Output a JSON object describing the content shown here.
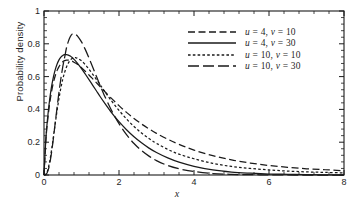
{
  "chart_data": {
    "type": "line",
    "title": "",
    "xlabel": "x",
    "ylabel": "Probability density",
    "xlim": [
      0,
      8
    ],
    "ylim": [
      0,
      1
    ],
    "grid": false,
    "legend_position": "upper-right",
    "x_ticks": [
      "0",
      "2",
      "4",
      "6",
      "8"
    ],
    "x_tick_values": [
      0,
      2,
      4,
      6,
      8
    ],
    "x_minor_per_interval": 4,
    "y_ticks": [
      "0",
      "0.2",
      "0.4",
      "0.6",
      "0.8",
      "1"
    ],
    "y_tick_values": [
      0,
      0.2,
      0.4,
      0.6,
      0.8,
      1
    ],
    "y_minor_per_interval": 4,
    "line_color": "#1a1a1a",
    "series": [
      {
        "name": "u = 4, v = 10",
        "u": 4,
        "v": 10,
        "dash": "medium-dash",
        "peak_x": 0.62,
        "peak_y": 0.7,
        "x": [
          0.0,
          0.05,
          0.1,
          0.15,
          0.2,
          0.25,
          0.3,
          0.35,
          0.4,
          0.45,
          0.5,
          0.55,
          0.6,
          0.65,
          0.7,
          0.75,
          0.8,
          0.85,
          0.9,
          1.0,
          1.1,
          1.2,
          1.3,
          1.4,
          1.5,
          1.6,
          1.8,
          2.0,
          2.2,
          2.4,
          2.6,
          2.8,
          3.0,
          3.3,
          3.6,
          4.0,
          4.5,
          5.0,
          5.5,
          6.0,
          6.5,
          7.0,
          7.5,
          8.0
        ],
        "y": [
          0.0,
          0.212,
          0.339,
          0.434,
          0.507,
          0.563,
          0.605,
          0.638,
          0.661,
          0.678,
          0.69,
          0.697,
          0.7,
          0.7,
          0.698,
          0.694,
          0.688,
          0.681,
          0.673,
          0.654,
          0.633,
          0.61,
          0.586,
          0.562,
          0.538,
          0.514,
          0.467,
          0.423,
          0.382,
          0.345,
          0.311,
          0.281,
          0.254,
          0.218,
          0.187,
          0.152,
          0.118,
          0.092,
          0.073,
          0.058,
          0.047,
          0.038,
          0.032,
          0.026
        ]
      },
      {
        "name": "u = 4, v = 30",
        "u": 4,
        "v": 30,
        "dash": "solid",
        "peak_x": 0.55,
        "peak_y": 0.73,
        "x": [
          0.0,
          0.05,
          0.1,
          0.15,
          0.2,
          0.25,
          0.3,
          0.35,
          0.4,
          0.45,
          0.5,
          0.55,
          0.6,
          0.65,
          0.7,
          0.75,
          0.8,
          0.85,
          0.9,
          1.0,
          1.1,
          1.2,
          1.3,
          1.4,
          1.5,
          1.6,
          1.8,
          2.0,
          2.2,
          2.4,
          2.6,
          2.8,
          3.0,
          3.3,
          3.6,
          4.0,
          4.5,
          5.0,
          5.5,
          6.0,
          6.5,
          7.0,
          7.5,
          8.0
        ],
        "y": [
          0.0,
          0.222,
          0.357,
          0.459,
          0.537,
          0.597,
          0.643,
          0.677,
          0.702,
          0.719,
          0.729,
          0.734,
          0.734,
          0.731,
          0.725,
          0.716,
          0.705,
          0.693,
          0.679,
          0.649,
          0.616,
          0.582,
          0.547,
          0.512,
          0.477,
          0.444,
          0.381,
          0.325,
          0.276,
          0.233,
          0.196,
          0.164,
          0.137,
          0.104,
          0.078,
          0.053,
          0.031,
          0.018,
          0.011,
          0.006,
          0.004,
          0.002,
          0.001,
          0.001
        ]
      },
      {
        "name": "u = 10, v = 10",
        "u": 10,
        "v": 10,
        "dash": "short-dash",
        "peak_x": 0.64,
        "peak_y": 0.75,
        "x": [
          0.0,
          0.05,
          0.1,
          0.15,
          0.2,
          0.25,
          0.3,
          0.35,
          0.4,
          0.45,
          0.5,
          0.55,
          0.6,
          0.65,
          0.7,
          0.75,
          0.8,
          0.85,
          0.9,
          1.0,
          1.1,
          1.2,
          1.3,
          1.4,
          1.5,
          1.6,
          1.8,
          2.0,
          2.2,
          2.4,
          2.6,
          2.8,
          3.0,
          3.3,
          3.6,
          4.0,
          4.5,
          5.0,
          5.5,
          6.0,
          6.5,
          7.0,
          7.5,
          8.0
        ],
        "y": [
          0.0,
          0.005,
          0.03,
          0.08,
          0.15,
          0.231,
          0.315,
          0.395,
          0.468,
          0.531,
          0.584,
          0.626,
          0.659,
          0.683,
          0.7,
          0.71,
          0.715,
          0.715,
          0.711,
          0.696,
          0.673,
          0.645,
          0.614,
          0.582,
          0.549,
          0.516,
          0.452,
          0.394,
          0.342,
          0.296,
          0.256,
          0.222,
          0.193,
          0.156,
          0.127,
          0.099,
          0.071,
          0.052,
          0.04,
          0.031,
          0.024,
          0.019,
          0.016,
          0.013
        ]
      },
      {
        "name": "u = 10, v = 30",
        "u": 10,
        "v": 30,
        "dash": "long-dash",
        "peak_x": 0.76,
        "peak_y": 0.86,
        "x": [
          0.0,
          0.05,
          0.1,
          0.15,
          0.2,
          0.25,
          0.3,
          0.35,
          0.4,
          0.45,
          0.5,
          0.55,
          0.6,
          0.65,
          0.7,
          0.75,
          0.8,
          0.85,
          0.9,
          1.0,
          1.1,
          1.2,
          1.3,
          1.4,
          1.5,
          1.6,
          1.8,
          2.0,
          2.2,
          2.4,
          2.6,
          2.8,
          3.0,
          3.3,
          3.6,
          4.0,
          4.5,
          5.0,
          5.5,
          6.0,
          6.5,
          7.0,
          7.5,
          8.0
        ],
        "y": [
          0.0,
          0.003,
          0.022,
          0.066,
          0.135,
          0.222,
          0.319,
          0.415,
          0.506,
          0.588,
          0.659,
          0.717,
          0.776,
          0.815,
          0.843,
          0.859,
          0.862,
          0.856,
          0.846,
          0.812,
          0.766,
          0.713,
          0.657,
          0.6,
          0.544,
          0.49,
          0.394,
          0.313,
          0.246,
          0.192,
          0.149,
          0.115,
          0.088,
          0.058,
          0.038,
          0.021,
          0.009,
          0.004,
          0.002,
          0.001,
          0.0,
          0.0,
          0.0,
          0.0
        ]
      }
    ]
  },
  "axes": {
    "ylabel": "Probability density",
    "xlabel": "x"
  }
}
